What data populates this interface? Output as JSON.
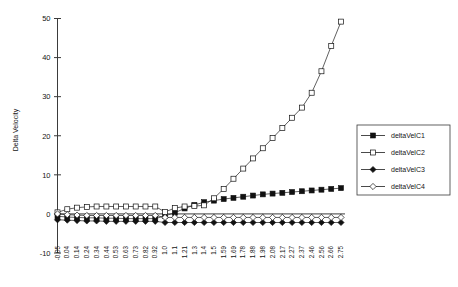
{
  "chart_data": {
    "type": "line",
    "title": "",
    "xlabel": "",
    "ylabel": "Delta Velocity",
    "ylim": [
      -10,
      50
    ],
    "yticks": [
      -10,
      0,
      10,
      20,
      30,
      40,
      50
    ],
    "ytick_labels": [
      "-10",
      "0",
      "10",
      "20",
      "30",
      "40",
      "50"
    ],
    "grid": false,
    "legend_position": "right",
    "categories": [
      "-0.05",
      "0.04",
      "0.14",
      "0.24",
      "0.34",
      "0.44",
      "0.53",
      "0.63",
      "0.73",
      "0.82",
      "0.92",
      "1.0",
      "1.1",
      "1.21",
      "1.3",
      "1.4",
      "1.5",
      "1.59",
      "1.69",
      "1.78",
      "1.88",
      "1.98",
      "2.08",
      "2.17",
      "2.27",
      "2.37",
      "2.46",
      "2.56",
      "2.66",
      "2.75"
    ],
    "x_values": [
      -0.05,
      0.04,
      0.14,
      0.24,
      0.34,
      0.44,
      0.53,
      0.63,
      0.73,
      0.82,
      0.92,
      1.0,
      1.1,
      1.21,
      1.3,
      1.4,
      1.5,
      1.59,
      1.69,
      1.78,
      1.88,
      1.98,
      2.08,
      2.17,
      2.27,
      2.37,
      2.46,
      2.56,
      2.66,
      2.75
    ],
    "series": [
      {
        "name": "deltaVelC1",
        "marker": "filled-square",
        "values": [
          -0.6,
          -0.8,
          -0.9,
          -1.0,
          -1.0,
          -1.1,
          -1.1,
          -1.2,
          -1.2,
          -1.2,
          -1.2,
          -0.5,
          0.3,
          1.4,
          2.3,
          3.0,
          3.4,
          3.8,
          4.1,
          4.4,
          4.7,
          5.0,
          5.2,
          5.4,
          5.6,
          5.8,
          6.0,
          6.2,
          6.4,
          6.6
        ]
      },
      {
        "name": "deltaVelC2",
        "marker": "open-square",
        "values": [
          0.4,
          1.2,
          1.6,
          1.8,
          1.9,
          1.9,
          1.9,
          1.9,
          1.9,
          1.9,
          1.9,
          0.5,
          1.5,
          1.9,
          2.0,
          2.2,
          4.0,
          6.4,
          9.0,
          11.6,
          14.2,
          16.8,
          19.4,
          22.0,
          24.6,
          27.2,
          31.0,
          36.5,
          43.0,
          49.2
        ]
      },
      {
        "name": "deltaVelC3",
        "marker": "filled-diamond",
        "values": [
          -1.5,
          -1.6,
          -1.7,
          -1.8,
          -1.8,
          -1.9,
          -1.9,
          -1.9,
          -1.9,
          -1.9,
          -1.9,
          -2.2,
          -2.2,
          -2.2,
          -2.2,
          -2.2,
          -2.2,
          -2.2,
          -2.2,
          -2.2,
          -2.2,
          -2.2,
          -2.2,
          -2.2,
          -2.2,
          -2.2,
          -2.2,
          -2.2,
          -2.2,
          -2.2
        ]
      },
      {
        "name": "deltaVelC4",
        "marker": "open-diamond",
        "values": [
          0.0,
          -0.2,
          -0.3,
          -0.4,
          -0.4,
          -0.4,
          -0.4,
          -0.4,
          -0.4,
          -0.4,
          -0.4,
          -0.9,
          -0.9,
          -0.9,
          -0.9,
          -0.9,
          -0.9,
          -0.9,
          -0.9,
          -0.9,
          -0.9,
          -0.9,
          -0.9,
          -0.9,
          -0.9,
          -0.9,
          -0.9,
          -0.9,
          -0.9,
          -0.9
        ]
      }
    ]
  },
  "legend": {
    "items": [
      {
        "label": "deltaVelC1",
        "marker": "filled-square"
      },
      {
        "label": "deltaVelC2",
        "marker": "open-square"
      },
      {
        "label": "deltaVelC3",
        "marker": "filled-diamond"
      },
      {
        "label": "deltaVelC4",
        "marker": "open-diamond"
      }
    ]
  }
}
